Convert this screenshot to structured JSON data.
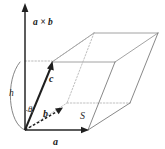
{
  "figure": {
    "width": 165,
    "height": 149,
    "background": "#ffffff"
  },
  "labels": {
    "cross_product": "a × b",
    "vector_a": "a",
    "vector_b": "b",
    "vector_c": "c",
    "area": "S",
    "height": "h",
    "angle": "θ"
  },
  "colors": {
    "vector_stroke": "#1f1f1f",
    "edge_stroke": "#8c8c8c",
    "hidden_edge_stroke": "#b0b0b0",
    "guide_stroke": "#a8a8a8",
    "label_fill": "#1a1a1a",
    "background": "#ffffff"
  },
  "geometry": {
    "origin": [
      25,
      130
    ],
    "axis_tip": [
      25,
      5
    ],
    "a_tip": [
      88,
      130
    ],
    "b_tip": [
      62,
      108
    ],
    "c_tip": [
      52,
      62
    ],
    "base_parallelogram": [
      [
        25,
        130
      ],
      [
        88,
        130
      ],
      [
        130,
        103
      ],
      [
        67,
        103
      ]
    ],
    "top_parallelogram": [
      [
        52,
        62
      ],
      [
        115,
        62
      ],
      [
        158,
        33
      ],
      [
        94,
        33
      ]
    ]
  },
  "icons": {
    "arrowhead_up": "arrowhead-up-icon",
    "arrowhead_right": "arrowhead-right-icon",
    "arrowhead_b": "arrowhead-b-icon",
    "arrowhead_c": "arrowhead-c-icon"
  }
}
